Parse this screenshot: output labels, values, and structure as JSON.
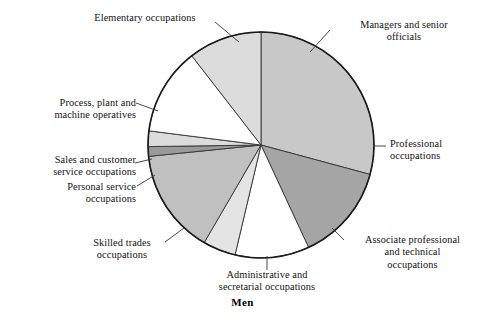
{
  "caption": "Men",
  "chart_data": {
    "type": "pie",
    "title": "Men",
    "subtitle": "",
    "xlabel": "",
    "ylabel": "",
    "grid": false,
    "legend": "none",
    "label_style": "leader-lines to outside labels",
    "center": {
      "x": 261,
      "y": 145
    },
    "radius": 113,
    "start_angle_deg": 0,
    "direction": "clockwise",
    "stroke_color": "#333333",
    "outline_color": "#1a1a1a",
    "categories": [
      "Managers and senior officials",
      "Professional occupations",
      "Associate professional and technical occupations",
      "Administrative and secretarial occupations",
      "Skilled trades occupations",
      "Personal service occupations",
      "Sales and customer service occupations",
      "Process, plant and machine operatives",
      "Elementary occupations"
    ],
    "values": [
      29.2,
      13.9,
      10.6,
      4.7,
      15.0,
      1.4,
      2.2,
      12.5,
      10.5
    ],
    "units": "percent",
    "angles_deg": [
      105.1,
      50.0,
      38.2,
      16.9,
      54.0,
      5.0,
      8.0,
      45.0,
      37.8
    ],
    "colors": [
      "#c8c8c8",
      "#a5a5a5",
      "#ffffff",
      "#e4e4e4",
      "#c0c0c0",
      "#9a9a9a",
      "#dcdcdc",
      "#ffffff",
      "#dcdcdc"
    ],
    "slices": [
      {
        "label": "Managers and senior officials",
        "value": 29.2,
        "start_deg": 0.0,
        "end_deg": 105.1,
        "color": "#c8c8c8"
      },
      {
        "label": "Professional occupations",
        "value": 13.9,
        "start_deg": 105.1,
        "end_deg": 155.1,
        "color": "#a5a5a5"
      },
      {
        "label": "Associate professional and technical occupations",
        "value": 10.6,
        "start_deg": 155.1,
        "end_deg": 193.3,
        "color": "#ffffff"
      },
      {
        "label": "Administrative and secretarial occupations",
        "value": 4.7,
        "start_deg": 193.3,
        "end_deg": 210.2,
        "color": "#e4e4e4"
      },
      {
        "label": "Skilled trades occupations",
        "value": 15.0,
        "start_deg": 210.2,
        "end_deg": 264.2,
        "color": "#c0c0c0"
      },
      {
        "label": "Personal service occupations",
        "value": 1.4,
        "start_deg": 264.2,
        "end_deg": 269.2,
        "color": "#9a9a9a"
      },
      {
        "label": "Sales and customer service occupations",
        "value": 2.2,
        "start_deg": 269.2,
        "end_deg": 277.2,
        "color": "#dcdcdc"
      },
      {
        "label": "Process, plant and machine operatives",
        "value": 12.5,
        "start_deg": 277.2,
        "end_deg": 322.2,
        "color": "#ffffff"
      },
      {
        "label": "Elementary occupations",
        "value": 10.5,
        "start_deg": 322.2,
        "end_deg": 360.0,
        "color": "#dcdcdc"
      }
    ]
  },
  "labels": {
    "elementary": "Elementary occupations",
    "managers": "Managers and senior\nofficials",
    "professional": "Professional\noccupations",
    "associate": "Associate professional\nand technical\noccupations",
    "administrative": "Administrative and\nsecretarial occupations",
    "skilled_trades": "Skilled trades\noccupations",
    "personal_service": "Personal service\noccupations",
    "sales": "Sales and customer\nservice occupations",
    "process_plant": "Process, plant and\nmachine operatives"
  }
}
